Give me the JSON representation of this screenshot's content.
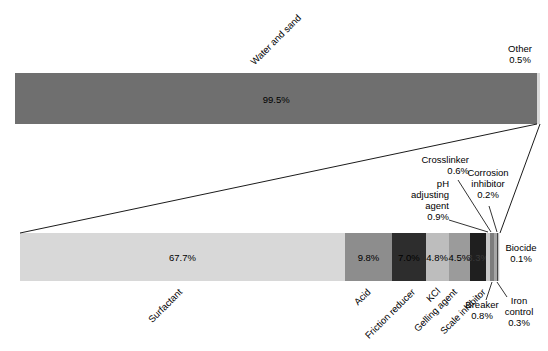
{
  "chart_data": {
    "type": "bar",
    "subtype": "stacked-horizontal-with-zoom-inset",
    "units": "%",
    "top_bar": {
      "segments": [
        {
          "id": "water-and-sand",
          "label": "Water and sand",
          "value": 99.5,
          "color": "#6f6f6f",
          "show_pct": true
        },
        {
          "id": "other",
          "label": "Other",
          "value": 0.5,
          "color": "#d9d9d9",
          "show_pct": false
        }
      ]
    },
    "bottom_bar": {
      "note": "breakdown of the 0.5% Other slice",
      "segments": [
        {
          "id": "surfactant",
          "label": "Surfactant",
          "value": 67.7,
          "color": "#d8d8d8",
          "show_pct": true
        },
        {
          "id": "acid",
          "label": "Acid",
          "value": 9.8,
          "color": "#8d8d8d",
          "show_pct": true
        },
        {
          "id": "friction-reducer",
          "label": "Friction reducer",
          "value": 7.0,
          "color": "#2d2d2d",
          "show_pct": true
        },
        {
          "id": "kcl",
          "label": "KCl",
          "value": 4.8,
          "color": "#bdbdbd",
          "show_pct": true
        },
        {
          "id": "gelling-agent",
          "label": "Gelling agent",
          "value": 4.5,
          "color": "#9b9b9b",
          "show_pct": true
        },
        {
          "id": "scale-inhibitor",
          "label": "Scale inhibitor",
          "value": 3.3,
          "color": "#1f1f1f",
          "show_pct": true,
          "pct_color": "#3a3a3a"
        },
        {
          "id": "ph-adjusting-agent",
          "label": "pH adjusting agent",
          "value": 0.9,
          "color": "#c9c9c9",
          "show_pct": false
        },
        {
          "id": "breaker",
          "label": "Breaker",
          "value": 0.8,
          "color": "#7d7d7d",
          "show_pct": false
        },
        {
          "id": "crosslinker",
          "label": "Crosslinker",
          "value": 0.6,
          "color": "#a6a6a6",
          "show_pct": false
        },
        {
          "id": "iron-control",
          "label": "Iron control",
          "value": 0.3,
          "color": "#454545",
          "show_pct": false
        },
        {
          "id": "corrosion-inhibitor",
          "label": "Corrosion inhibitor",
          "value": 0.2,
          "color": "#bfbfbf",
          "show_pct": false
        },
        {
          "id": "biocide",
          "label": "Biocide",
          "value": 0.1,
          "color": "#efefef",
          "show_pct": false
        }
      ]
    },
    "callouts": {
      "other": {
        "name": "Other",
        "pct": "0.5%"
      },
      "ph_adjusting_agent": {
        "name": "pH adjusting agent",
        "pct": "0.9%"
      },
      "crosslinker": {
        "name": "Crosslinker",
        "pct": "0.6%"
      },
      "corrosion_inhibitor": {
        "name": "Corrosion inhibitor",
        "pct": "0.2%"
      },
      "breaker": {
        "name": "Breaker",
        "pct": "0.8%"
      },
      "iron_control": {
        "name": "Iron control",
        "pct": "0.3%"
      },
      "biocide": {
        "name": "Biocide",
        "pct": "0.1%"
      }
    }
  }
}
